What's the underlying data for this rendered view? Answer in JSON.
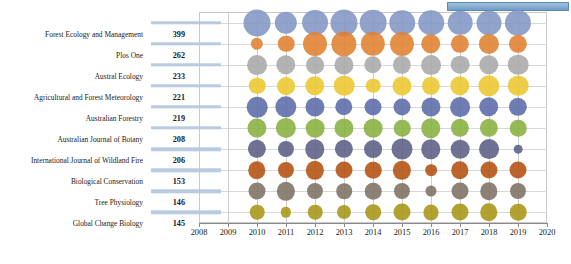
{
  "chart_data": {
    "type": "scatter",
    "variant": "bubble",
    "title": "",
    "xlabel": "",
    "ylabel": "",
    "xlim": [
      2008,
      2020
    ],
    "x_ticks": [
      2008,
      2009,
      2010,
      2011,
      2012,
      2013,
      2014,
      2015,
      2016,
      2017,
      2018,
      2019,
      2020
    ],
    "years": [
      2010,
      2011,
      2012,
      2013,
      2014,
      2015,
      2016,
      2017,
      2018,
      2019
    ],
    "grid": true,
    "legend": "none",
    "categories": [
      "Forest Ecology and Management",
      "Plos One",
      "Austral Ecology",
      "Agricultural and Forest Meteorology",
      "Australian Forestry",
      "Australian Journal of Botany",
      "International Journal of Wildland Fire",
      "Biological Conservation",
      "Tree Physiology",
      "Global Change Biology"
    ],
    "totals": [
      399,
      262,
      233,
      221,
      219,
      208,
      206,
      153,
      146,
      145
    ],
    "colors": [
      "#8296c4",
      "#e08130",
      "#a9a9a9",
      "#ecc62e",
      "#5a6ca8",
      "#86b13f",
      "#5b5f84",
      "#b3500f",
      "#7c7163",
      "#a79516"
    ],
    "series": [
      {
        "name": "Forest Ecology and Management",
        "values": [
          48,
          33,
          44,
          48,
          47,
          43,
          43,
          40,
          41,
          45
        ]
      },
      {
        "name": "Plos One",
        "values": [
          10,
          18,
          38,
          42,
          39,
          38,
          25,
          22,
          27,
          22
        ]
      },
      {
        "name": "Austral Ecology",
        "values": [
          26,
          25,
          21,
          24,
          20,
          22,
          26,
          23,
          25,
          28
        ]
      },
      {
        "name": "Agricultural and Forest Meteorology",
        "values": [
          18,
          21,
          25,
          28,
          14,
          24,
          22,
          25,
          30,
          28
        ]
      },
      {
        "name": "Australian Forestry",
        "values": [
          28,
          30,
          24,
          20,
          19,
          19,
          24,
          26,
          25,
          22
        ]
      },
      {
        "name": "Australian Journal of Botany",
        "values": [
          24,
          27,
          23,
          24,
          23,
          18,
          25,
          22,
          22,
          18
        ]
      },
      {
        "name": "International Journal of Wildland Fire",
        "values": [
          22,
          17,
          25,
          22,
          21,
          29,
          25,
          23,
          26,
          5
        ]
      },
      {
        "name": "Biological Conservation",
        "values": [
          20,
          17,
          22,
          19,
          18,
          22,
          9,
          20,
          19,
          19
        ]
      },
      {
        "name": "Tree Physiology",
        "values": [
          19,
          22,
          17,
          16,
          18,
          17,
          8,
          19,
          20,
          17
        ]
      },
      {
        "name": "Global Change Biology",
        "values": [
          14,
          7,
          14,
          13,
          16,
          19,
          15,
          19,
          20,
          18
        ]
      }
    ],
    "size_note": "Bubble area encodes publication count per journal per year"
  },
  "ui": {
    "top_bar_name": "window-title-bar"
  }
}
